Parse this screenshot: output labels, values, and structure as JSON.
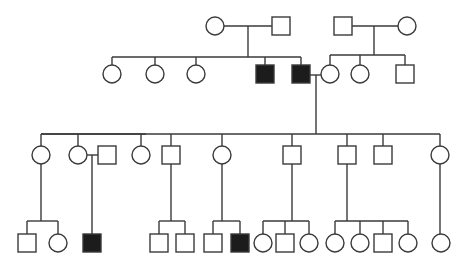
{
  "diagram": {
    "type": "pedigree",
    "title": "",
    "legend": {
      "square": "male",
      "circle": "female",
      "filled": "affected",
      "open": "unaffected"
    },
    "colors": {
      "line": "#3a3a3a",
      "affected_fill": "#1c1c1c",
      "unaffected_fill": "#ffffff"
    },
    "size": 18,
    "individuals": [
      {
        "id": "I-1",
        "sex": "female",
        "affected": false,
        "x": 215,
        "y": 26
      },
      {
        "id": "I-2",
        "sex": "male",
        "affected": false,
        "x": 281,
        "y": 26
      },
      {
        "id": "I-3",
        "sex": "male",
        "affected": false,
        "x": 343,
        "y": 26
      },
      {
        "id": "I-4",
        "sex": "female",
        "affected": false,
        "x": 407,
        "y": 26
      },
      {
        "id": "II-1",
        "sex": "female",
        "affected": false,
        "x": 112,
        "y": 74
      },
      {
        "id": "II-2",
        "sex": "female",
        "affected": false,
        "x": 155,
        "y": 74
      },
      {
        "id": "II-3",
        "sex": "female",
        "affected": false,
        "x": 196,
        "y": 74
      },
      {
        "id": "II-4",
        "sex": "male",
        "affected": true,
        "x": 265,
        "y": 74
      },
      {
        "id": "II-5",
        "sex": "male",
        "affected": true,
        "x": 301,
        "y": 74
      },
      {
        "id": "II-6",
        "sex": "female",
        "affected": false,
        "x": 330,
        "y": 74
      },
      {
        "id": "II-7",
        "sex": "female",
        "affected": false,
        "x": 360,
        "y": 74
      },
      {
        "id": "II-8",
        "sex": "male",
        "affected": false,
        "x": 405,
        "y": 74
      },
      {
        "id": "III-1",
        "sex": "female",
        "affected": false,
        "x": 41,
        "y": 155
      },
      {
        "id": "III-2",
        "sex": "female",
        "affected": false,
        "x": 78,
        "y": 155
      },
      {
        "id": "III-3",
        "sex": "male",
        "affected": false,
        "x": 107,
        "y": 155
      },
      {
        "id": "III-4",
        "sex": "female",
        "affected": false,
        "x": 141,
        "y": 155
      },
      {
        "id": "III-5",
        "sex": "male",
        "affected": false,
        "x": 171,
        "y": 155
      },
      {
        "id": "III-6",
        "sex": "female",
        "affected": false,
        "x": 222,
        "y": 155
      },
      {
        "id": "III-7",
        "sex": "male",
        "affected": false,
        "x": 292,
        "y": 155
      },
      {
        "id": "III-8",
        "sex": "male",
        "affected": false,
        "x": 347,
        "y": 155
      },
      {
        "id": "III-9",
        "sex": "male",
        "affected": false,
        "x": 383,
        "y": 155
      },
      {
        "id": "III-10",
        "sex": "female",
        "affected": false,
        "x": 440,
        "y": 155
      },
      {
        "id": "IV-1",
        "sex": "male",
        "affected": false,
        "x": 27,
        "y": 243
      },
      {
        "id": "IV-2",
        "sex": "female",
        "affected": false,
        "x": 58,
        "y": 243
      },
      {
        "id": "IV-3",
        "sex": "male",
        "affected": true,
        "x": 92,
        "y": 243
      },
      {
        "id": "IV-4",
        "sex": "male",
        "affected": false,
        "x": 159,
        "y": 243
      },
      {
        "id": "IV-5",
        "sex": "male",
        "affected": false,
        "x": 185,
        "y": 243
      },
      {
        "id": "IV-6",
        "sex": "male",
        "affected": false,
        "x": 213,
        "y": 243
      },
      {
        "id": "IV-7",
        "sex": "male",
        "affected": true,
        "x": 240,
        "y": 243
      },
      {
        "id": "IV-8",
        "sex": "female",
        "affected": false,
        "x": 263,
        "y": 243
      },
      {
        "id": "IV-9",
        "sex": "male",
        "affected": false,
        "x": 285,
        "y": 243
      },
      {
        "id": "IV-10",
        "sex": "female",
        "affected": false,
        "x": 309,
        "y": 243
      },
      {
        "id": "IV-11",
        "sex": "female",
        "affected": false,
        "x": 335,
        "y": 243
      },
      {
        "id": "IV-12",
        "sex": "female",
        "affected": false,
        "x": 360,
        "y": 243
      },
      {
        "id": "IV-13",
        "sex": "male",
        "affected": false,
        "x": 383,
        "y": 243
      },
      {
        "id": "IV-14",
        "sex": "female",
        "affected": false,
        "x": 408,
        "y": 243
      },
      {
        "id": "IV-15",
        "sex": "female",
        "affected": false,
        "x": 441,
        "y": 243
      }
    ],
    "lines": [
      [
        224,
        26,
        272,
        26
      ],
      [
        248,
        26,
        248,
        57
      ],
      [
        112,
        57,
        301,
        57
      ],
      [
        112,
        57,
        112,
        65
      ],
      [
        155,
        57,
        155,
        65
      ],
      [
        196,
        57,
        196,
        65
      ],
      [
        265,
        57,
        265,
        65
      ],
      [
        301,
        57,
        301,
        65
      ],
      [
        352,
        26,
        398,
        26
      ],
      [
        374,
        26,
        374,
        55
      ],
      [
        330,
        55,
        405,
        55
      ],
      [
        330,
        55,
        330,
        65
      ],
      [
        360,
        55,
        360,
        65
      ],
      [
        405,
        55,
        405,
        65
      ],
      [
        310,
        75,
        321,
        75
      ],
      [
        316,
        75,
        316,
        134
      ],
      [
        41,
        134,
        440,
        134
      ],
      [
        41,
        134,
        146,
        134
      ],
      [
        41,
        134,
        41,
        146
      ],
      [
        78,
        134,
        78,
        146
      ],
      [
        141,
        134,
        141,
        146
      ],
      [
        171,
        134,
        171,
        146
      ],
      [
        222,
        134,
        222,
        146
      ],
      [
        292,
        134,
        292,
        146
      ],
      [
        347,
        134,
        347,
        146
      ],
      [
        383,
        134,
        383,
        146
      ],
      [
        440,
        134,
        440,
        146
      ],
      [
        87,
        155,
        98,
        155
      ],
      [
        92,
        155,
        92,
        234
      ],
      [
        41,
        164,
        41,
        221
      ],
      [
        27,
        221,
        58,
        221
      ],
      [
        27,
        221,
        27,
        234
      ],
      [
        58,
        221,
        58,
        234
      ],
      [
        171,
        164,
        171,
        221
      ],
      [
        159,
        221,
        185,
        221
      ],
      [
        159,
        221,
        159,
        234
      ],
      [
        185,
        221,
        185,
        234
      ],
      [
        222,
        164,
        222,
        221
      ],
      [
        213,
        221,
        240,
        221
      ],
      [
        213,
        221,
        213,
        234
      ],
      [
        240,
        221,
        240,
        234
      ],
      [
        292,
        164,
        292,
        221
      ],
      [
        263,
        221,
        309,
        221
      ],
      [
        263,
        221,
        263,
        234
      ],
      [
        285,
        221,
        285,
        234
      ],
      [
        309,
        221,
        309,
        234
      ],
      [
        347,
        164,
        347,
        221
      ],
      [
        335,
        221,
        408,
        221
      ],
      [
        335,
        221,
        335,
        234
      ],
      [
        360,
        221,
        360,
        234
      ],
      [
        383,
        221,
        383,
        234
      ],
      [
        408,
        221,
        408,
        234
      ],
      [
        440,
        164,
        440,
        234
      ]
    ]
  }
}
